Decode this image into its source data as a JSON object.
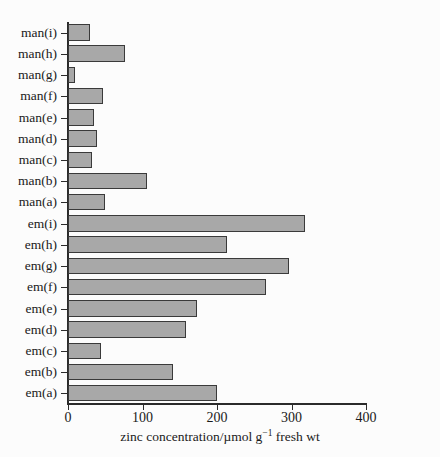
{
  "chart_data": {
    "type": "bar",
    "orientation": "horizontal",
    "title": "",
    "xlabel": "zinc concentration/µmol g⁻¹ fresh wt",
    "ylabel": "",
    "xlim": [
      0,
      400
    ],
    "xticks": [
      0,
      100,
      200,
      300,
      400
    ],
    "xticklabels": [
      "0",
      "100",
      "200",
      "300",
      "400"
    ],
    "grid": false,
    "legend": null,
    "bar_color": "#a8a8a8",
    "bar_edge_color": "#3a3a3a",
    "categories": [
      "em(a)",
      "em(b)",
      "em(c)",
      "em(d)",
      "em(e)",
      "em(f)",
      "em(g)",
      "em(h)",
      "em(i)",
      "man(a)",
      "man(b)",
      "man(c)",
      "man(d)",
      "man(e)",
      "man(f)",
      "man(g)",
      "man(h)",
      "man(i)"
    ],
    "values": [
      200,
      141,
      44,
      158,
      173,
      266,
      297,
      213,
      318,
      50,
      106,
      32,
      39,
      35,
      47,
      9,
      77,
      30
    ]
  },
  "axis": {
    "x_title_main": "zinc concentration/µmol g",
    "x_title_sup": "−1",
    "x_title_tail": " fresh wt"
  }
}
